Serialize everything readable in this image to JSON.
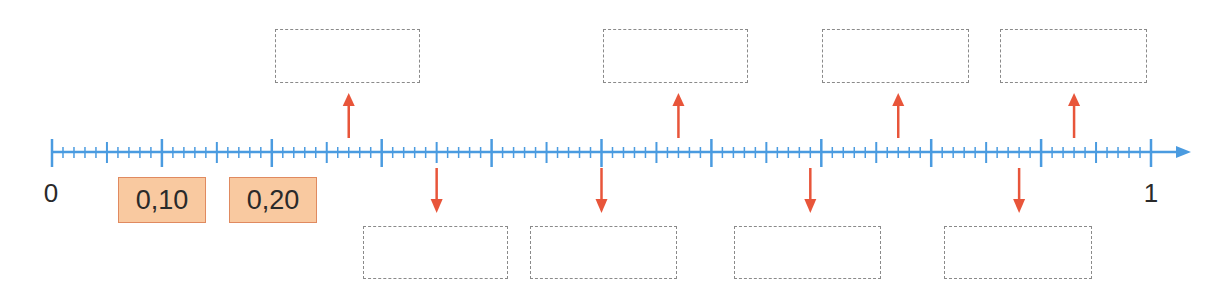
{
  "number_line": {
    "start_label": "0",
    "end_label": "1",
    "min": 0,
    "max": 1,
    "major_step": 0.1,
    "medium_step": 0.05,
    "minor_step": 0.01,
    "axis_color": "#4a9be0",
    "arrow_color": "#e8553a"
  },
  "given_labels": [
    {
      "value": 0.1,
      "text": "0,10"
    },
    {
      "value": 0.2,
      "text": "0,20"
    }
  ],
  "given_box_colors": {
    "fill": "#f9c9a0",
    "border": "#e08a60"
  },
  "answer_boxes": {
    "top": [
      {
        "pointer_value": 0.27,
        "text": ""
      },
      {
        "pointer_value": 0.57,
        "text": ""
      },
      {
        "pointer_value": 0.77,
        "text": ""
      },
      {
        "pointer_value": 0.93,
        "text": ""
      }
    ],
    "bottom": [
      {
        "pointer_value": 0.35,
        "text": ""
      },
      {
        "pointer_value": 0.5,
        "text": ""
      },
      {
        "pointer_value": 0.69,
        "text": ""
      },
      {
        "pointer_value": 0.88,
        "text": ""
      }
    ]
  }
}
